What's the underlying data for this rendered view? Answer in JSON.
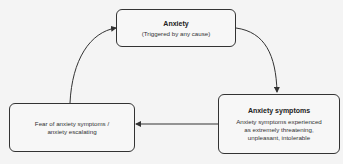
{
  "nodes": {
    "anxiety": {
      "title": "Anxiety",
      "text": "(Triggered by any cause)"
    },
    "symptoms": {
      "title": "Anxiety symptoms",
      "text_lines": [
        "Anxiety symptoms experienced",
        "as extremely threatening,",
        "unpleasant, intolerable"
      ]
    },
    "fear": {
      "text_lines": [
        "Fear of anxiety symptoms /",
        "anxiety escalating"
      ]
    }
  },
  "edges": [
    {
      "from": "anxiety",
      "to": "symptoms"
    },
    {
      "from": "symptoms",
      "to": "fear"
    },
    {
      "from": "fear",
      "to": "anxiety"
    }
  ],
  "colors": {
    "stroke": "#333333",
    "background": "#f4f4f4"
  }
}
